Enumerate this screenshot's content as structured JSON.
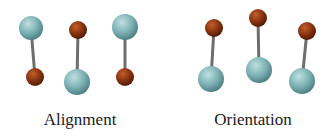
{
  "colors": {
    "large_atom": "#7fb3b5",
    "small_atom": "#8a3410",
    "bond": "#6e6e6e",
    "background": "#ffffff"
  },
  "panels": [
    {
      "label": "Alignment",
      "label_x": 80,
      "molecules": [
        {
          "large": {
            "cx": 31,
            "cy": 28,
            "r": 12
          },
          "small": {
            "cx": 35,
            "cy": 77,
            "r": 9
          }
        },
        {
          "large": {
            "cx": 77,
            "cy": 82,
            "r": 13
          },
          "small": {
            "cx": 78,
            "cy": 30,
            "r": 9
          }
        },
        {
          "large": {
            "cx": 125,
            "cy": 27,
            "r": 13
          },
          "small": {
            "cx": 125,
            "cy": 77,
            "r": 9
          }
        }
      ]
    },
    {
      "label": "Orientation",
      "label_x": 253,
      "molecules": [
        {
          "large": {
            "cx": 211,
            "cy": 79,
            "r": 13
          },
          "small": {
            "cx": 214,
            "cy": 28,
            "r": 9
          }
        },
        {
          "large": {
            "cx": 259,
            "cy": 70,
            "r": 13
          },
          "small": {
            "cx": 258,
            "cy": 18,
            "r": 9
          }
        },
        {
          "large": {
            "cx": 302,
            "cy": 81,
            "r": 13
          },
          "small": {
            "cx": 307,
            "cy": 31,
            "r": 9
          }
        }
      ]
    }
  ]
}
